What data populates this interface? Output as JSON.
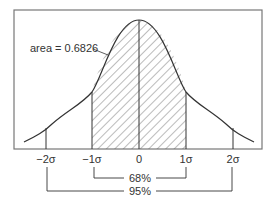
{
  "diagram": {
    "type": "normal-distribution",
    "area_label": "area = 0.6826",
    "x_ticks": [
      {
        "label": "−2σ",
        "x": 46
      },
      {
        "label": "−1σ",
        "x": 92
      },
      {
        "label": "0",
        "x": 139
      },
      {
        "label": "1σ",
        "x": 186
      },
      {
        "label": "2σ",
        "x": 233
      }
    ],
    "brackets": [
      {
        "label": "68%",
        "from": "−1σ",
        "to": "1σ"
      },
      {
        "label": "95%",
        "from": "−2σ",
        "to": "2σ"
      }
    ],
    "colors": {
      "line": "#333333",
      "frame": "#777777",
      "hatch": "#555555"
    }
  }
}
